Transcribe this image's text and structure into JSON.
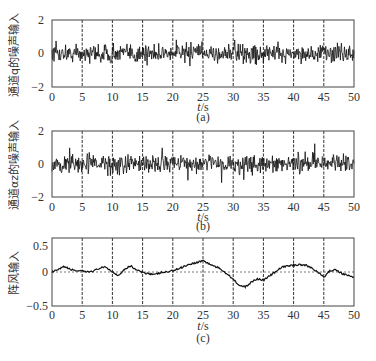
{
  "chart_data": [
    {
      "type": "line",
      "panel": "(a)",
      "title": "",
      "caption": "(a)",
      "xlabel": "t/s",
      "ylabel": "通道q的噪声输入",
      "xlim": [
        0,
        50
      ],
      "ylim": [
        -2,
        2
      ],
      "xticks": [
        0,
        5,
        10,
        15,
        20,
        25,
        30,
        35,
        40,
        45,
        50
      ],
      "yticks": [
        -2,
        0,
        2
      ],
      "grid": "vertical dashed at x=5,10,...,45",
      "description": "White-noise signal centered at 0, amplitude mostly within about ±0.6, peaks near ±1",
      "noise_stats": {
        "mean": 0,
        "typical_amplitude": 0.5,
        "peak_amplitude": 1.0
      }
    },
    {
      "type": "line",
      "panel": "(b)",
      "title": "",
      "caption": "(b)",
      "xlabel": "t/s",
      "ylabel": "通道αz的噪声输入",
      "xlim": [
        0,
        50
      ],
      "ylim": [
        -2,
        2
      ],
      "xticks": [
        0,
        5,
        10,
        15,
        20,
        25,
        30,
        35,
        40,
        45,
        50
      ],
      "yticks": [
        -2,
        0,
        2
      ],
      "grid": "vertical dashed at x=5,10,...,45",
      "description": "White-noise signal centered at 0, amplitude mostly within about ±0.6, occasional spikes near +1.3",
      "noise_stats": {
        "mean": 0,
        "typical_amplitude": 0.5,
        "peak_amplitude": 1.3
      }
    },
    {
      "type": "line",
      "panel": "(c)",
      "title": "",
      "caption": "(c)",
      "xlabel": "t/s",
      "ylabel": "阵风输入",
      "xlim": [
        0,
        50
      ],
      "ylim": [
        -0.5,
        0.5
      ],
      "xticks": [
        0,
        5,
        10,
        15,
        20,
        25,
        30,
        35,
        40,
        45,
        50
      ],
      "yticks": [
        -0.5,
        0,
        0.5
      ],
      "grid": "vertical dashed at x=5,...,45; horizontal dotted at y=0",
      "x": [
        0,
        1,
        2,
        3,
        4,
        5,
        6,
        7,
        8,
        9,
        10,
        11,
        12,
        13,
        14,
        15,
        16,
        17,
        18,
        19,
        20,
        21,
        22,
        23,
        24,
        25,
        26,
        27,
        28,
        29,
        30,
        31,
        32,
        33,
        34,
        35,
        36,
        37,
        38,
        39,
        40,
        41,
        42,
        43,
        44,
        45,
        46,
        47,
        48,
        49,
        50
      ],
      "values": [
        0.0,
        0.03,
        0.08,
        0.04,
        0.02,
        0.01,
        0.0,
        0.02,
        0.06,
        0.07,
        0.0,
        -0.05,
        0.04,
        0.09,
        0.03,
        -0.01,
        -0.02,
        -0.04,
        -0.01,
        0.0,
        0.02,
        0.05,
        0.09,
        0.12,
        0.14,
        0.17,
        0.12,
        0.08,
        0.04,
        -0.03,
        -0.1,
        -0.2,
        -0.22,
        -0.15,
        -0.1,
        -0.12,
        -0.06,
        0.0,
        0.07,
        0.09,
        0.1,
        0.11,
        0.1,
        0.06,
        0.0,
        -0.08,
        0.02,
        0.03,
        -0.02,
        -0.05,
        -0.08
      ]
    }
  ],
  "panels": [
    {
      "caption": "(a)",
      "ylabel": "通道q的噪声输入",
      "yticks": [
        "2",
        "0",
        "−2"
      ],
      "xticks": [
        "0",
        "5",
        "10",
        "15",
        "20",
        "25",
        "30",
        "35",
        "40",
        "45",
        "50"
      ],
      "xlabel_var": "t",
      "xlabel_unit": "/s"
    },
    {
      "caption": "(b)",
      "ylabel": "通道αz的噪声输入",
      "yticks": [
        "2",
        "0",
        "−2"
      ],
      "xticks": [
        "0",
        "5",
        "10",
        "15",
        "20",
        "25",
        "30",
        "35",
        "40",
        "45",
        "50"
      ],
      "xlabel_var": "t",
      "xlabel_unit": "/s"
    },
    {
      "caption": "(c)",
      "ylabel": "阵风输入",
      "yticks": [
        "0.5",
        "0",
        "−0.5"
      ],
      "xticks": [
        "0",
        "5",
        "10",
        "15",
        "20",
        "25",
        "30",
        "35",
        "40",
        "45",
        "50"
      ],
      "xlabel_var": "t",
      "xlabel_unit": "/s"
    }
  ],
  "colors": {
    "trace": "#1a1a1a",
    "frame": "#444444",
    "grid": "#333333"
  }
}
